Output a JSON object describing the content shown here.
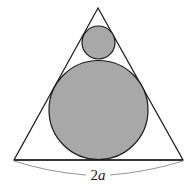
{
  "diagram": {
    "base_label_number": "2",
    "base_label_variable": "a",
    "colors": {
      "stroke": "#1a1a1a",
      "circle_fill": "#a8a8a8",
      "arc": "#888888",
      "background": "#ffffff"
    }
  }
}
